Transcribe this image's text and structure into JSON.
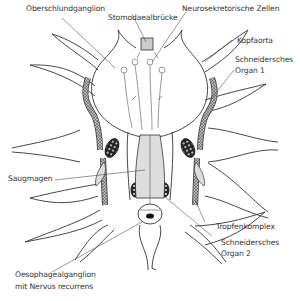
{
  "diagram": {
    "type": "anatomical-illustration",
    "labels": {
      "oberschlundganglion": "Oberschlundganglion",
      "stomodaealbruecke": "Stomodaealbrücke",
      "neurosekretorische_zellen": "Neurosekretorische Zellen",
      "kopfaorta": "Kopfaorta",
      "schneidersches_organ_1_line1": "Schneidersches",
      "schneidersches_organ_1_line2": "Organ 1",
      "saugmagen": "Saugmagen",
      "tropfenkomplex": "Tropfenkomplex",
      "schneidersches_organ_2_line1": "Schneidersches",
      "schneidersches_organ_2_line2": "Organ 2",
      "oesophagealganglion_line1": "Oesophagealganglion",
      "oesophagealganglion_line2": "mit Nervus recurrens"
    },
    "colors": {
      "line": "#333333",
      "fill_gray": "#d8d8d8",
      "dark": "#222222",
      "background": "#ffffff"
    }
  }
}
